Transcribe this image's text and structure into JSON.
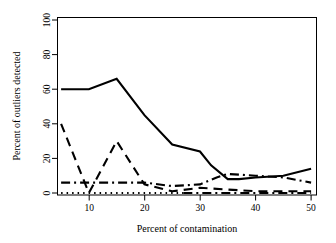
{
  "chart_data": {
    "type": "line",
    "title": "",
    "subtitle": "",
    "xlabel": "Percent of contamination",
    "ylabel": "Percent of outliers detected",
    "xlim": [
      5,
      50
    ],
    "ylim": [
      0,
      100
    ],
    "xticks": [
      10,
      20,
      30,
      40,
      50
    ],
    "xticklabels": [
      "10",
      "20",
      "30",
      "40",
      "50"
    ],
    "yticks": [
      0,
      20,
      40,
      60,
      80,
      100
    ],
    "yticklabels": [
      "0",
      "20",
      "40",
      "60",
      "80",
      "100"
    ],
    "grid": false,
    "legend": "none",
    "x": [
      5,
      10,
      15,
      20,
      25,
      30,
      35,
      40,
      45,
      50
    ],
    "series": [
      {
        "name": "solid",
        "style": "solid",
        "x": [
          5,
          10,
          15,
          20,
          25,
          30,
          32,
          35,
          37,
          40,
          45,
          50
        ],
        "values": [
          60,
          60,
          66,
          45,
          28,
          24,
          16,
          8,
          8,
          9,
          10,
          14
        ]
      },
      {
        "name": "dashed",
        "style": "dashed",
        "x": [
          5,
          10,
          15,
          20,
          25,
          30,
          35,
          40,
          45,
          50
        ],
        "values": [
          40,
          0,
          30,
          5,
          1,
          3,
          2,
          1,
          1,
          1
        ]
      },
      {
        "name": "dash-dot",
        "style": "dashdot",
        "x": [
          5,
          10,
          15,
          20,
          25,
          30,
          33,
          35,
          40,
          45,
          50
        ],
        "values": [
          6,
          6,
          6,
          6,
          4,
          5,
          9,
          11,
          10,
          9,
          6
        ]
      },
      {
        "name": "dotted",
        "style": "dotted",
        "x": [
          5,
          10,
          15,
          20,
          25,
          27
        ],
        "values": [
          0,
          0,
          0,
          0,
          0,
          0
        ]
      },
      {
        "name": "dash-dot-baseline",
        "style": "dashdot",
        "x": [
          27,
          30,
          35,
          40,
          45,
          50
        ],
        "values": [
          0,
          0,
          0,
          0,
          0,
          0
        ]
      }
    ],
    "colors": {
      "axis": "#000000",
      "line": "#000000",
      "background": "#ffffff"
    }
  }
}
